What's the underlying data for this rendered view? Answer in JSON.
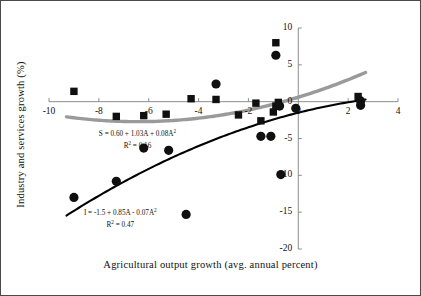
{
  "figure": {
    "frame_color": "#4a4a4a",
    "background": "#ffffff"
  },
  "annotations": {
    "services_eq_main": "S = 0.60 + 1.03A + 0.08A",
    "services_eq_exp": "2",
    "services_r2_label": "R",
    "services_r2_exp": "2",
    "services_r2_value": " = 0.16",
    "industry_eq_main": "I = -1.5 + 0.85A - 0.07A",
    "industry_eq_exp": "2",
    "industry_r2_label": "R",
    "industry_r2_exp": "2",
    "industry_r2_value": " = 0.47"
  },
  "chart_data": {
    "type": "scatter",
    "title": "",
    "xlabel": "Agricultural output growth (avg. annual percent)",
    "ylabel": "Industry and services growth (%)",
    "xlim": [
      -10,
      4
    ],
    "ylim": [
      -20,
      10
    ],
    "xticks": [
      -10,
      -8,
      -6,
      -4,
      -2,
      0,
      2,
      4
    ],
    "xticklabels": [
      "-10",
      "-8",
      "-6",
      "-4",
      "-2",
      "0",
      "2",
      "4"
    ],
    "yticks": [
      10,
      5,
      0,
      -5,
      -10,
      -15,
      -20
    ],
    "yticklabels": [
      "10",
      "5",
      "0",
      "-5",
      "-10",
      "-15",
      "-20"
    ],
    "grid": false,
    "legend": "none",
    "axis_style": "crossed-at-zero",
    "colors": {
      "industry_marker": "#101010",
      "services_marker": "#101010",
      "industry_curve": "#000000",
      "services_curve": "#9a9a9a",
      "axis": "#808080",
      "text": "#111111"
    },
    "series": [
      {
        "name": "Industry",
        "marker": "circle",
        "color": "#101010",
        "points": [
          [
            -9.0,
            -13.0
          ],
          [
            -7.3,
            -10.8
          ],
          [
            -6.2,
            -6.3
          ],
          [
            -5.2,
            -6.6
          ],
          [
            -4.5,
            -15.3
          ],
          [
            -3.3,
            2.4
          ],
          [
            -1.5,
            -4.7
          ],
          [
            -1.1,
            -4.7
          ],
          [
            -0.9,
            6.3
          ],
          [
            -0.75,
            -0.6
          ],
          [
            -0.7,
            -9.9
          ],
          [
            -0.1,
            -0.9
          ],
          [
            2.5,
            -0.5
          ],
          [
            2.5,
            0.1
          ]
        ]
      },
      {
        "name": "Services",
        "marker": "square",
        "color": "#101010",
        "points": [
          [
            -9.0,
            1.4
          ],
          [
            -7.3,
            -2.0
          ],
          [
            -6.2,
            -1.9
          ],
          [
            -5.3,
            -1.7
          ],
          [
            -4.3,
            0.4
          ],
          [
            -3.3,
            0.3
          ],
          [
            -2.4,
            -1.8
          ],
          [
            -1.7,
            -0.2
          ],
          [
            -1.5,
            -2.6
          ],
          [
            -1.0,
            -1.4
          ],
          [
            -0.9,
            -0.6
          ],
          [
            -0.9,
            8.0
          ],
          [
            -0.8,
            -0.1
          ],
          [
            2.4,
            0.7
          ]
        ]
      }
    ],
    "fits": [
      {
        "name": "Services fit",
        "equation": "S = 0.60 + 1.03A + 0.08A^2",
        "coefficients": {
          "a0": 0.6,
          "a1": 1.03,
          "a2": 0.08
        },
        "r_squared": 0.16,
        "color": "#9a9a9a",
        "linewidth": 3.4,
        "x_range": [
          -9.3,
          2.7
        ]
      },
      {
        "name": "Industry fit",
        "equation": "I = -1.5 + 0.85A - 0.07A^2",
        "coefficients": {
          "a0": -1.5,
          "a1": 0.85,
          "a2": -0.07
        },
        "r_squared": 0.47,
        "color": "#000000",
        "linewidth": 2.1,
        "x_range": [
          -9.3,
          2.7
        ]
      }
    ]
  }
}
